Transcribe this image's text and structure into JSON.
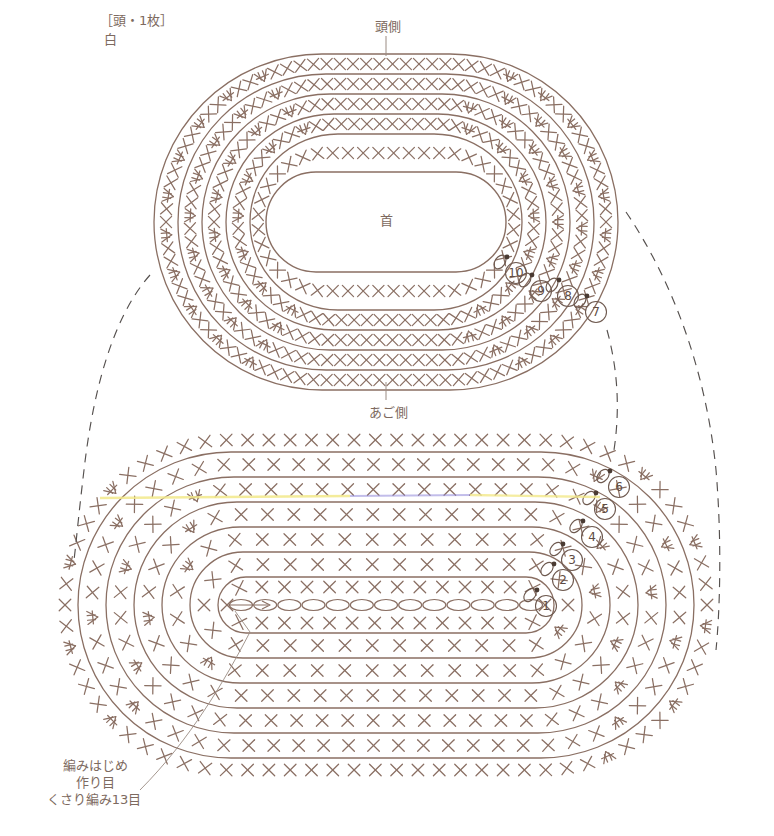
{
  "page": {
    "width": 774,
    "height": 836,
    "background": "#ffffff",
    "ink": "#8a6f63",
    "ink_dark": "#6f5a50",
    "text_color": "#7d6a60",
    "dash_color": "#55504e",
    "highlight_yellow": "#f2e98a",
    "highlight_purple": "#8f86d8"
  },
  "labels": {
    "part_title": "［頭・1枚］",
    "part_color": "白",
    "top_side": "頭側",
    "bottom_side": "あご側",
    "center_hole": "首",
    "start_note_line1": "編みはじめ",
    "start_note_line2": "作り目",
    "start_note_line3": "くさり編み13目"
  },
  "diagrams": {
    "head_piece": {
      "name": "頭側 / あご側 oval (head ring)",
      "cx": 386,
      "cy": 222,
      "rounds": [
        {
          "number": 7,
          "rx": 232,
          "ry": 168
        },
        {
          "number": 8,
          "rx": 208,
          "ry": 148
        },
        {
          "number": 9,
          "rx": 184,
          "ry": 128
        },
        {
          "number": 10,
          "rx": 160,
          "ry": 108
        },
        {
          "number": null,
          "rx": 136,
          "ry": 88
        }
      ],
      "round_markers": [
        {
          "number": 10,
          "x": 516,
          "y": 273
        },
        {
          "number": 9,
          "x": 541,
          "y": 291
        },
        {
          "number": 8,
          "x": 568,
          "y": 296
        },
        {
          "number": 7,
          "x": 596,
          "y": 312
        }
      ],
      "inner_hole": {
        "rx": 120,
        "ry": 50
      }
    },
    "body_piece": {
      "name": "body oval (worked from chain)",
      "cx": 386,
      "cy": 605,
      "foundation_chain_count": 13,
      "rounds": [
        {
          "number": 1,
          "rx": 168,
          "ry": 28
        },
        {
          "number": 2,
          "rx": 196,
          "ry": 53
        },
        {
          "number": 3,
          "rx": 224,
          "ry": 78
        },
        {
          "number": 4,
          "rx": 252,
          "ry": 103
        },
        {
          "number": 5,
          "rx": 280,
          "ry": 128
        },
        {
          "number": 6,
          "rx": 308,
          "ry": 153
        }
      ],
      "round_markers": [
        {
          "number": 6,
          "x": 619,
          "y": 487
        },
        {
          "number": 5,
          "x": 605,
          "y": 509
        },
        {
          "number": 4,
          "x": 592,
          "y": 537
        },
        {
          "number": 3,
          "x": 572,
          "y": 560
        },
        {
          "number": 2,
          "x": 563,
          "y": 580
        },
        {
          "number": 1,
          "x": 546,
          "y": 606
        }
      ]
    }
  },
  "legend_symbols": [
    {
      "key": "single-crochet",
      "glyph": "X",
      "meaning": "こま編み"
    },
    {
      "key": "increase",
      "glyph": "双",
      "meaning": "こま編み2目編み入れる"
    },
    {
      "key": "chain",
      "glyph": "oval",
      "meaning": "くさり編み"
    },
    {
      "key": "slip-stitch",
      "glyph": "dot",
      "meaning": "引き抜き編み"
    }
  ]
}
